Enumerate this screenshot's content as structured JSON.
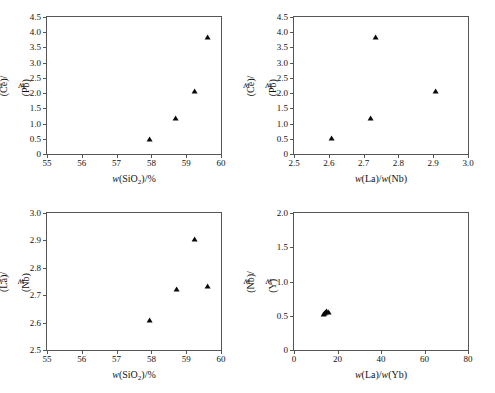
{
  "figure": {
    "title": "",
    "panel_count": 4,
    "marker_symbol": "filled-triangle",
    "marker_color": "#0a0a0a",
    "axis_color": "#555555",
    "background": "#ffffff"
  },
  "chart_data": [
    {
      "id": "top-left",
      "type": "scatter",
      "title": "",
      "xlabel": "w(SiO2)/%",
      "xlabel_parts": {
        "prefix": "w",
        "open": "(SiO",
        "sub": "2",
        "close": ")/%"
      },
      "ylabel": "w(Ce)/w(Pb)",
      "xlim": [
        55,
        60
      ],
      "ylim": [
        0,
        4.5
      ],
      "xticks": [
        55,
        56,
        57,
        58,
        59,
        60
      ],
      "xtick_labels": [
        "55",
        "56",
        "57",
        "58",
        "59",
        "60"
      ],
      "yticks": [
        0,
        0.5,
        1.0,
        1.5,
        2.0,
        2.5,
        3.0,
        3.5,
        4.0,
        4.5
      ],
      "ytick_labels": [
        "0",
        "0.5",
        "1.0",
        "1.5",
        "2.0",
        "2.5",
        "3.0",
        "3.5",
        "4.0",
        "4.5"
      ],
      "grid": false,
      "legend": "none",
      "points": [
        {
          "x": 57.95,
          "y": 0.47
        },
        {
          "x": 58.72,
          "y": 1.15
        },
        {
          "x": 59.25,
          "y": 2.04
        },
        {
          "x": 59.62,
          "y": 3.82
        }
      ]
    },
    {
      "id": "top-right",
      "type": "scatter",
      "title": "",
      "xlabel": "w(La)/w(Nb)",
      "ylabel": "w(Ce)/w(Pb)",
      "xlim": [
        2.5,
        3.0
      ],
      "ylim": [
        0,
        4.5
      ],
      "xticks": [
        2.5,
        2.6,
        2.7,
        2.8,
        2.9,
        3.0
      ],
      "xtick_labels": [
        "2.5",
        "2.6",
        "2.7",
        "2.8",
        "2.9",
        "3.0"
      ],
      "yticks": [
        0,
        0.5,
        1.0,
        1.5,
        2.0,
        2.5,
        3.0,
        3.5,
        4.0,
        4.5
      ],
      "ytick_labels": [
        "0",
        "0.5",
        "1.0",
        "1.5",
        "2.0",
        "2.5",
        "3.0",
        "3.5",
        "4.0",
        "4.5"
      ],
      "grid": false,
      "legend": "none",
      "points": [
        {
          "x": 2.608,
          "y": 0.49
        },
        {
          "x": 2.722,
          "y": 1.16
        },
        {
          "x": 2.735,
          "y": 3.82
        },
        {
          "x": 2.908,
          "y": 2.04
        }
      ]
    },
    {
      "id": "bottom-left",
      "type": "scatter",
      "title": "",
      "xlabel": "w(SiO2)/%",
      "xlabel_parts": {
        "prefix": "w",
        "open": "(SiO",
        "sub": "2",
        "close": ")/%"
      },
      "ylabel": "w(La)/w(Nb)",
      "xlim": [
        55,
        60
      ],
      "ylim": [
        2.5,
        3.0
      ],
      "xticks": [
        55,
        56,
        57,
        58,
        59,
        60
      ],
      "xtick_labels": [
        "55",
        "56",
        "57",
        "58",
        "59",
        "60"
      ],
      "yticks": [
        2.5,
        2.6,
        2.7,
        2.8,
        2.9,
        3.0
      ],
      "ytick_labels": [
        "2.5",
        "2.6",
        "2.7",
        "2.8",
        "2.9",
        "3.0"
      ],
      "grid": false,
      "legend": "none",
      "points": [
        {
          "x": 57.95,
          "y": 2.607
        },
        {
          "x": 58.73,
          "y": 2.718
        },
        {
          "x": 59.25,
          "y": 2.903
        },
        {
          "x": 59.62,
          "y": 2.731
        }
      ]
    },
    {
      "id": "bottom-right",
      "type": "scatter",
      "title": "",
      "xlabel": "w(La)/w(Yb)",
      "ylabel": "w(Nb)/w(Y)",
      "xlim": [
        0,
        80
      ],
      "ylim": [
        0,
        2.0
      ],
      "xticks": [
        0,
        20,
        40,
        60,
        80
      ],
      "xtick_labels": [
        "0",
        "20",
        "40",
        "60",
        "80"
      ],
      "yticks": [
        0,
        0.5,
        1.0,
        1.5,
        2.0
      ],
      "ytick_labels": [
        "0",
        "0.5",
        "1.0",
        "1.5",
        "2.0"
      ],
      "grid": false,
      "legend": "none",
      "points": [
        {
          "x": 13.6,
          "y": 0.515
        },
        {
          "x": 14.2,
          "y": 0.528
        },
        {
          "x": 14.8,
          "y": 0.535
        },
        {
          "x": 15.4,
          "y": 0.552
        },
        {
          "x": 15.9,
          "y": 0.545
        }
      ]
    }
  ]
}
